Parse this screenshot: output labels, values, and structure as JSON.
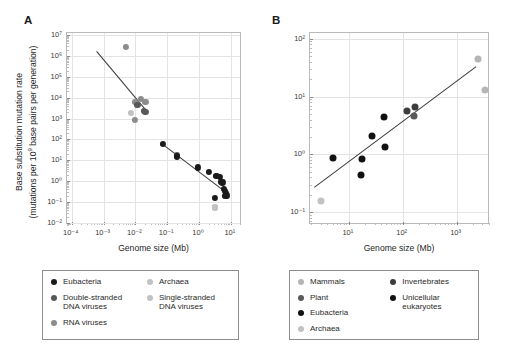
{
  "figure": {
    "width": 514,
    "height": 362,
    "background": "#ffffff"
  },
  "colors": {
    "eubacteria": "#1a1a1a",
    "dsdna_viruses": "#585858",
    "rna_viruses": "#8c8c8c",
    "archaea": "#c2c2c2",
    "ssdna_viruses": "#c2c2c2",
    "mammals": "#b5b5b5",
    "plant": "#5a5a5a",
    "invertebrates": "#3c3c3c",
    "unicellular_eukaryotes": "#111111",
    "fit_line": "#3a3a3a",
    "grid": "#e3e3e3",
    "frame": "#b9b9b9",
    "text": "#2b2b2b"
  },
  "panels": {
    "a": {
      "label": "A",
      "xlabel": "Genome size (Mb)",
      "ylabel_line1": "Base substitution mutation rate",
      "ylabel_line2": "(mutations per 10⁹ base pairs per generation)",
      "ylabel_line2_pre": "(mutations per 10",
      "ylabel_line2_sup": "9",
      "ylabel_line2_post": " base pairs per generation)",
      "x_ticks": [
        "10⁻⁴",
        "10⁻³",
        "10⁻²",
        "10⁻¹",
        "10⁰",
        "10¹"
      ],
      "x_tick_exp": [
        -4,
        -3,
        -2,
        -1,
        0,
        1
      ],
      "y_ticks": [
        "10⁻²",
        "10⁻¹",
        "10⁰",
        "10¹",
        "10²",
        "10³",
        "10⁴",
        "10⁵",
        "10⁶",
        "10⁷"
      ],
      "y_tick_exp": [
        -2,
        -1,
        0,
        1,
        2,
        3,
        4,
        5,
        6,
        7
      ],
      "xlim": [
        -4.15,
        1.35
      ],
      "ylim": [
        -2.1,
        7.1
      ]
    },
    "b": {
      "label": "B",
      "xlabel": "Genome size (Mb)",
      "x_ticks": [
        "10¹",
        "10²",
        "10³"
      ],
      "x_tick_exp": [
        1,
        2,
        3
      ],
      "y_ticks": [
        "10⁻¹",
        "10⁰",
        "10¹",
        "10²"
      ],
      "y_tick_exp": [
        -1,
        0,
        1,
        2
      ],
      "xlim": [
        0.28,
        3.62
      ],
      "ylim": [
        -1.22,
        2.1
      ]
    }
  },
  "chart_data": [
    {
      "type": "scatter",
      "panel": "A",
      "title": "",
      "xlabel": "Genome size (Mb)",
      "ylabel": "Base substitution mutation rate (mutations per 10^9 base pairs per generation)",
      "xscale": "log",
      "yscale": "log",
      "xlim": [
        0.0001,
        10
      ],
      "ylim": [
        0.01,
        10000000
      ],
      "grid": true,
      "legend_position": "below",
      "trend_lines": [
        {
          "name": "virus-fit",
          "x1": 0.00062,
          "y1": 1650000,
          "x2": 0.024,
          "y2": 2100
        },
        {
          "name": "cellular-fit",
          "x1": 0.072,
          "y1": 62,
          "x2": 8.2,
          "y2": 0.26
        }
      ],
      "series": [
        {
          "name": "RNA viruses",
          "color": "#8c8c8c",
          "points": [
            {
              "x": 0.0051,
              "y": 2600000
            },
            {
              "x": 0.0097,
              "y": 6400
            },
            {
              "x": 0.0113,
              "y": 5200
            },
            {
              "x": 0.015,
              "y": 8500
            },
            {
              "x": 0.0205,
              "y": 6300
            },
            {
              "x": 0.0096,
              "y": 830
            }
          ]
        },
        {
          "name": "Single-stranded DNA viruses",
          "color": "#c2c2c2",
          "points": [
            {
              "x": 0.0073,
              "y": 1900
            },
            {
              "x": 3.1,
              "y": 0.055
            }
          ]
        },
        {
          "name": "Double-stranded DNA viruses",
          "color": "#585858",
          "points": [
            {
              "x": 0.0115,
              "y": 4400
            },
            {
              "x": 0.0185,
              "y": 2400
            },
            {
              "x": 0.0205,
              "y": 2150
            },
            {
              "x": 0.205,
              "y": 17.5
            }
          ]
        },
        {
          "name": "Eubacteria",
          "color": "#1a1a1a",
          "points": [
            {
              "x": 0.072,
              "y": 62
            },
            {
              "x": 0.2,
              "y": 15.5
            },
            {
              "x": 0.92,
              "y": 4.6
            },
            {
              "x": 2.1,
              "y": 2.9
            },
            {
              "x": 3.5,
              "y": 1.85
            },
            {
              "x": 4.6,
              "y": 1.55
            },
            {
              "x": 4.8,
              "y": 0.95
            },
            {
              "x": 5.4,
              "y": 0.88
            },
            {
              "x": 6.2,
              "y": 0.42
            },
            {
              "x": 6.5,
              "y": 0.33
            },
            {
              "x": 6.9,
              "y": 0.27
            },
            {
              "x": 7.1,
              "y": 0.22
            },
            {
              "x": 7.4,
              "y": 0.21
            },
            {
              "x": 3.2,
              "y": 0.155
            },
            {
              "x": 6.6,
              "y": 0.19
            }
          ]
        },
        {
          "name": "Archaea",
          "color": "#c2c2c2",
          "points": [
            {
              "x": 3.1,
              "y": 0.055
            }
          ]
        }
      ]
    },
    {
      "type": "scatter",
      "panel": "B",
      "title": "",
      "xlabel": "Genome size (Mb)",
      "ylabel": "",
      "xscale": "log",
      "yscale": "log",
      "xlim": [
        1.9,
        4200
      ],
      "ylim": [
        0.06,
        100
      ],
      "grid": true,
      "legend_position": "below",
      "trend_lines": [
        {
          "name": "eukaryote-fit",
          "x1": 2.3,
          "y1": 0.27,
          "x2": 2300,
          "y2": 33
        }
      ],
      "series": [
        {
          "name": "Unicellular eukaryotes",
          "color": "#111111",
          "points": [
            {
              "x": 5.2,
              "y": 0.86
            },
            {
              "x": 16.5,
              "y": 0.45
            },
            {
              "x": 17.5,
              "y": 0.85
            },
            {
              "x": 27.0,
              "y": 2.1
            },
            {
              "x": 45.0,
              "y": 4.4
            },
            {
              "x": 47.0,
              "y": 1.35
            }
          ]
        },
        {
          "name": "Invertebrates",
          "color": "#3c3c3c",
          "points": [
            {
              "x": 118,
              "y": 5.6
            },
            {
              "x": 170,
              "y": 6.6
            }
          ]
        },
        {
          "name": "Plant",
          "color": "#5a5a5a",
          "points": [
            {
              "x": 160,
              "y": 4.7
            }
          ]
        },
        {
          "name": "Mammals",
          "color": "#b5b5b5",
          "points": [
            {
              "x": 2550,
              "y": 44
            },
            {
              "x": 3300,
              "y": 13
            }
          ]
        },
        {
          "name": "Archaea",
          "color": "#c2c2c2",
          "points": [
            {
              "x": 3.1,
              "y": 0.155
            }
          ]
        }
      ]
    }
  ],
  "legend_a": {
    "columns": [
      {
        "items": [
          {
            "label": "Eubacteria",
            "color": "#1a1a1a"
          },
          {
            "label": "Double-stranded\nDNA viruses",
            "color": "#585858"
          },
          {
            "label": "RNA viruses",
            "color": "#8c8c8c"
          }
        ]
      },
      {
        "items": [
          {
            "label": "Archaea",
            "color": "#c2c2c2"
          },
          {
            "label": "Single-stranded\nDNA viruses",
            "color": "#c2c2c2"
          }
        ]
      }
    ]
  },
  "legend_b": {
    "columns": [
      {
        "items": [
          {
            "label": "Mammals",
            "color": "#b5b5b5"
          },
          {
            "label": "Plant",
            "color": "#5a5a5a"
          },
          {
            "label": "Eubacteria",
            "color": "#111111"
          },
          {
            "label": "Archaea",
            "color": "#c2c2c2"
          }
        ]
      },
      {
        "items": [
          {
            "label": "Invertebrates",
            "color": "#3c3c3c"
          },
          {
            "label": "Unicellular\neukaryotes",
            "color": "#111111"
          }
        ]
      }
    ]
  }
}
